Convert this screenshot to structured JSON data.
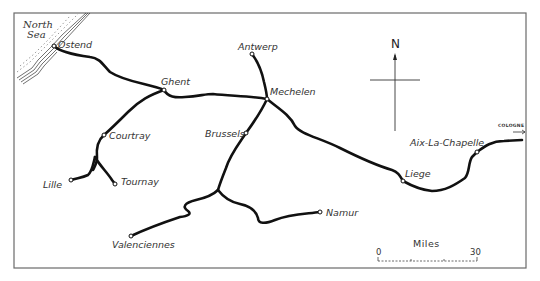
{
  "map": {
    "title": "Railway lines of Belgium (historical)",
    "frame_color": "#6a6a6a",
    "rail_color": "#111111",
    "sea": {
      "label_line1": "North",
      "label_line2": "Sea"
    },
    "compass": {
      "label": "N"
    },
    "edge_label": {
      "text": "COLOGNE",
      "arrow": "→"
    },
    "scale": {
      "title": "Miles",
      "start": "0",
      "end": "30"
    },
    "towns": [
      {
        "name": "Ostend",
        "x": 54,
        "y": 46
      },
      {
        "name": "Ghent",
        "x": 164,
        "y": 90
      },
      {
        "name": "Antwerp",
        "x": 252,
        "y": 54
      },
      {
        "name": "Mechelen",
        "x": 267,
        "y": 99
      },
      {
        "name": "Brussels",
        "x": 246,
        "y": 133
      },
      {
        "name": "Courtray",
        "x": 104,
        "y": 135
      },
      {
        "name": "Lille",
        "x": 71,
        "y": 180
      },
      {
        "name": "Tournay",
        "x": 115,
        "y": 184
      },
      {
        "name": "Valenciennes",
        "x": 131,
        "y": 236
      },
      {
        "name": "Namur",
        "x": 320,
        "y": 212
      },
      {
        "name": "Liege",
        "x": 403,
        "y": 181
      },
      {
        "name": "Aix-La-Chapelle",
        "x": 477,
        "y": 152
      }
    ]
  }
}
